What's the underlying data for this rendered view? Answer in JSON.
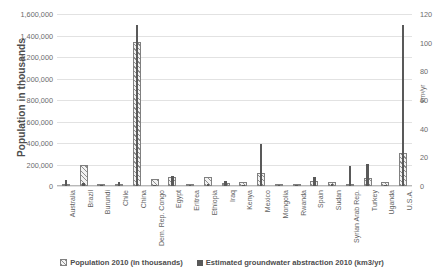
{
  "chart_data": {
    "type": "bar",
    "title": "",
    "xlabel": "",
    "ylabel": "Population in thousands",
    "y2label": "km³/yr",
    "ylim": [
      0,
      1600000
    ],
    "y2lim": [
      0,
      120
    ],
    "grid": true,
    "legend_position": "bottom",
    "y_ticks": [
      "0",
      "200,000",
      "400,000",
      "600,000",
      "800,000",
      "1,000,000",
      "1,200,000",
      "1,400,000",
      "1,600,000"
    ],
    "y_tick_values": [
      0,
      200000,
      400000,
      600000,
      800000,
      1000000,
      1200000,
      1400000,
      1600000
    ],
    "y2_ticks": [
      "0",
      "20",
      "40",
      "60",
      "80",
      "100",
      "120"
    ],
    "y2_tick_values": [
      0,
      20,
      40,
      60,
      80,
      100,
      120
    ],
    "categories": [
      "Australia",
      "Brazil",
      "Burundi",
      "Chile",
      "China",
      "Dem. Rep. Congo",
      "Egypt",
      "Eritrea",
      "Ethiopia",
      "Iraq",
      "Kenya",
      "Mexico",
      "Mongolia",
      "Rwanda",
      "Spain",
      "Sudan",
      "Syrian Arab Rep.",
      "Turkey",
      "Uganda",
      "U.S.A."
    ],
    "series": [
      {
        "name": "Population 2010 (in thousands)",
        "axis": "left",
        "units": "thousands",
        "values": [
          22300,
          195200,
          8400,
          17100,
          1341300,
          62200,
          81100,
          5700,
          87600,
          31700,
          40500,
          117900,
          2800,
          10600,
          46200,
          36100,
          20400,
          72100,
          33400,
          310400
        ]
      },
      {
        "name": "Estimated groundwater abstraction 2010 (km3/yr)",
        "axis": "right",
        "units": "km3/yr",
        "values": [
          4.5,
          2.0,
          0.1,
          2.5,
          112.0,
          0.2,
          7.0,
          0.1,
          1.5,
          3.5,
          0.6,
          29.0,
          0.2,
          0.1,
          6.0,
          1.5,
          14.0,
          15.5,
          0.3,
          112.0
        ]
      }
    ]
  },
  "legend": {
    "items": [
      {
        "label": "Population 2010 (in thousands)",
        "swatch": "hatched-bar-swatch"
      },
      {
        "label": "Estimated groundwater abstraction 2010 (km3/yr)",
        "swatch": "solid-dark-swatch"
      }
    ]
  },
  "colors": {
    "population_bar_fill": "#f2f2f2",
    "population_bar_hatch": "#8f8f8f",
    "population_bar_border": "#808080",
    "groundwater_bar": "#595959",
    "gridline": "#e2e2e2",
    "text": "#595959",
    "background": "#ffffff"
  }
}
